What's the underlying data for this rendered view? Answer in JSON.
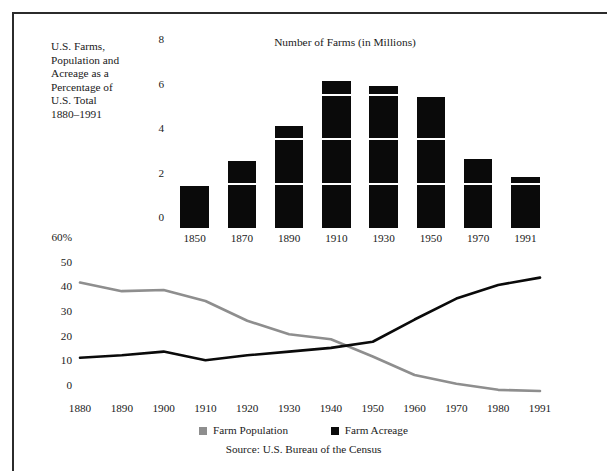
{
  "caption": {
    "lines": [
      "U.S. Farms,",
      "Population and",
      "Acreage as a",
      "Percentage of",
      "U.S. Total",
      "1880–1991"
    ]
  },
  "legend": {
    "items": [
      {
        "label": "Farm Population",
        "color": "#8e8e8e",
        "swatch_name": "legend-swatch-farm-population"
      },
      {
        "label": "Farm Acreage",
        "color": "#0a0a0a",
        "swatch_name": "legend-swatch-farm-acreage"
      }
    ]
  },
  "source": {
    "text": "Source: U.S. Bureau of the Census"
  },
  "colors": {
    "farm_population": "#8e8e8e",
    "farm_acreage": "#0a0a0a",
    "bar_fill": "#0a0a0a",
    "frame": "#2b2b2b",
    "background": "#ffffff"
  },
  "chart_data": [
    {
      "type": "bar",
      "title": "Number of Farms (in Millions)",
      "xlabel": "",
      "ylabel": "",
      "categories": [
        "1850",
        "1870",
        "1890",
        "1910",
        "1930",
        "1950",
        "1970",
        "1991"
      ],
      "values": [
        1.9,
        3.0,
        4.6,
        6.6,
        6.4,
        5.9,
        3.1,
        2.3
      ],
      "yticks": [
        0,
        2,
        4,
        6,
        8
      ],
      "ylim": [
        0,
        8
      ],
      "grid": false,
      "legend": "none",
      "note": "Bars are solid black with thin white rules at every 2 million, giving a stacked appearance."
    },
    {
      "type": "line",
      "title": "",
      "xlabel": "",
      "ylabel": "",
      "x": [
        "1880",
        "1890",
        "1900",
        "1910",
        "1920",
        "1930",
        "1940",
        "1950",
        "1960",
        "1970",
        "1980",
        "1991"
      ],
      "yticks": [
        "0",
        "10",
        "20",
        "30",
        "40",
        "50",
        "60%"
      ],
      "ylim": [
        0,
        60
      ],
      "grid": false,
      "legend": "bottom-center",
      "series": [
        {
          "name": "Farm Population",
          "color": "#8e8e8e",
          "values": [
            46,
            42.5,
            43,
            38.5,
            30.5,
            25,
            23,
            16,
            8.5,
            5,
            2.5,
            2
          ]
        },
        {
          "name": "Farm Acreage",
          "color": "#0a0a0a",
          "values": [
            15.5,
            16.5,
            18,
            14.5,
            16.5,
            18,
            19.5,
            22,
            31,
            39.5,
            45,
            48
          ]
        }
      ]
    }
  ]
}
